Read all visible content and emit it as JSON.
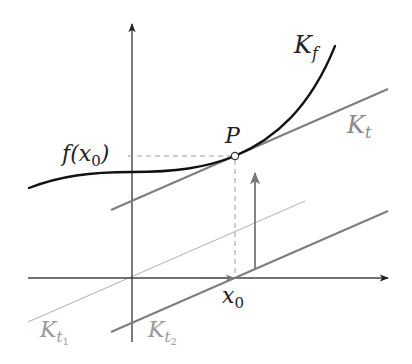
{
  "diagram": {
    "type": "function-graph-tangent",
    "colors": {
      "curve": "#111111",
      "axes": "#333333",
      "tangent": "#808080",
      "parallel_thin": "#a8a8a8",
      "dashed": "#999999",
      "label_dark": "#222222",
      "label_gray": "#8a8a8a"
    },
    "labels": {
      "curve": "K",
      "curve_sub": "f",
      "tangent": "K",
      "tangent_sub": "t",
      "point": "P",
      "y_value": "f(x",
      "y_value_sub": "0",
      "y_value_close": ")",
      "x_value": "x",
      "x_value_sub": "0",
      "parallel1": "K",
      "parallel1_sub": "t",
      "parallel1_subsub": "1",
      "parallel2": "K",
      "parallel2_sub": "t",
      "parallel2_subsub": "2"
    }
  }
}
